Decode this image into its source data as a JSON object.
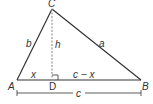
{
  "diagram": {
    "vertices": {
      "A": {
        "label": "A"
      },
      "B": {
        "label": "B"
      },
      "C": {
        "label": "C"
      },
      "D": {
        "label": "D"
      }
    },
    "sides": {
      "a": "a",
      "b": "b",
      "h": "h",
      "x": "x",
      "c_minus_x": "c − x",
      "c": "c"
    },
    "colors": {
      "line": "#333333",
      "altitude": "#999999",
      "background": "#ffffff"
    }
  }
}
